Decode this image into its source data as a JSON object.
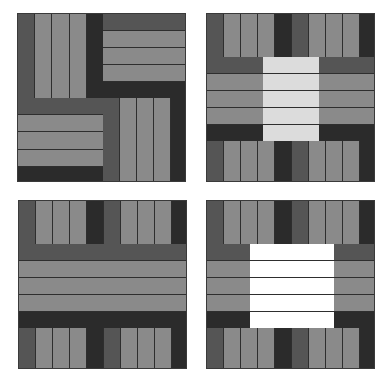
{
  "figure": {
    "colors": {
      "medium_dark": "#555555",
      "light_gray": "#8a8a8a",
      "dark": "#2b2b2b",
      "pale": "#dcdcdc",
      "white": "#ffffff",
      "line": "#2e2e2e"
    },
    "panels": [
      {
        "id": "top-left",
        "pattern": "four-patch rail fence (alternating vertical/horizontal strip blocks)"
      },
      {
        "id": "top-right",
        "pattern": "strip bands with pale center square"
      },
      {
        "id": "bottom-left",
        "pattern": "vertical strip bands top and bottom with full-width horizontal band"
      },
      {
        "id": "bottom-right",
        "pattern": "strip bands with white center square"
      }
    ]
  }
}
